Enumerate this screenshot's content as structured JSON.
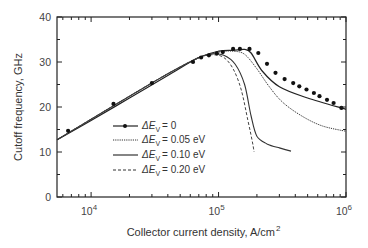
{
  "chart_data": {
    "type": "line",
    "title": "",
    "xlabel": "Collector current density, A/cm",
    "xlabel_superscript": "2",
    "ylabel": "Cutoff frequency, GHz",
    "xscale": "log",
    "xlim": [
      5400,
      1000000
    ],
    "ylim": [
      0,
      40
    ],
    "x_ticks": [
      {
        "value": 10000,
        "base": "10",
        "exp": "4"
      },
      {
        "value": 100000,
        "base": "10",
        "exp": "5"
      },
      {
        "value": 1000000,
        "base": "10",
        "exp": "6"
      }
    ],
    "y_ticks": [
      "0",
      "10",
      "20",
      "30",
      "40"
    ],
    "grid": false,
    "legend_position": "lower left (inside)",
    "series": [
      {
        "name": "ΔEv = 0",
        "style": "solid-with-markers",
        "x": [
          5400,
          10000,
          20000,
          40000,
          70000,
          100000,
          130000,
          160000,
          180000,
          220000,
          300000,
          500000,
          1000000
        ],
        "y": [
          12.7,
          17.0,
          22.0,
          27.0,
          31.0,
          32.4,
          32.6,
          32.8,
          32.0,
          28.0,
          24.5,
          22.0,
          19.5
        ],
        "markers_x": [
          6600,
          15000,
          30000,
          63000,
          73000,
          84000,
          97000,
          108000,
          130000,
          147000,
          175000,
          205000,
          240000,
          280000,
          330000,
          385000,
          430000,
          490000,
          560000,
          620000,
          710000,
          800000,
          920000
        ],
        "markers_y": [
          14.7,
          20.7,
          25.3,
          30.0,
          31.0,
          31.5,
          31.9,
          32.2,
          32.9,
          32.9,
          32.9,
          32.0,
          29.6,
          27.6,
          26.2,
          25.3,
          24.6,
          23.9,
          23.1,
          22.4,
          21.6,
          20.9,
          19.8
        ]
      },
      {
        "name": "ΔEv = 0.05 eV",
        "style": "dotted",
        "x": [
          5400,
          10000,
          20000,
          40000,
          70000,
          100000,
          130000,
          160000,
          200000,
          250000,
          320000,
          450000,
          650000,
          1000000
        ],
        "y": [
          12.7,
          17.3,
          22.4,
          27.4,
          30.9,
          32.2,
          32.4,
          31.7,
          28.5,
          24.5,
          21.0,
          18.0,
          15.8,
          14.6
        ]
      },
      {
        "name": "ΔEv = 0.10 eV",
        "style": "solid",
        "x": [
          5400,
          10000,
          20000,
          40000,
          70000,
          90000,
          110000,
          135000,
          160000,
          180000,
          200000,
          240000,
          300000,
          370000
        ],
        "y": [
          12.7,
          17.3,
          22.4,
          27.4,
          31.0,
          31.8,
          31.5,
          29.5,
          25.0,
          18.0,
          13.5,
          11.8,
          10.9,
          10.2
        ]
      },
      {
        "name": "ΔEv = 0.20 eV",
        "style": "dashed",
        "x": [
          5400,
          10000,
          20000,
          40000,
          70000,
          90000,
          110000,
          130000,
          150000,
          170000,
          185000,
          190000
        ],
        "y": [
          12.7,
          17.3,
          22.4,
          27.4,
          31.0,
          31.6,
          31.0,
          28.5,
          24.0,
          17.0,
          12.0,
          10.0
        ]
      }
    ]
  },
  "legend": {
    "items": [
      {
        "symbol": "ΔE",
        "sub": "V",
        "value": "= 0"
      },
      {
        "symbol": "ΔE",
        "sub": "V",
        "value": "= 0.05 eV"
      },
      {
        "symbol": "ΔE",
        "sub": "V",
        "value": "= 0.10 eV"
      },
      {
        "symbol": "ΔE",
        "sub": "V",
        "value": "= 0.20 eV"
      }
    ]
  }
}
